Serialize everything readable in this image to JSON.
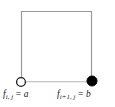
{
  "figure": {
    "background_color": "#ffffff",
    "edge_color": "#9a9a9a",
    "marker_outline_color": "#1a1a1a",
    "marker_fill_open": "#ffffff",
    "marker_fill_closed": "#000000",
    "text_color": "#151515"
  },
  "square": {
    "left": 21,
    "top": 11,
    "right": 92,
    "bottom": 82,
    "stroke_width": 1
  },
  "nodes": [
    {
      "id": "node-open",
      "style": "open-circle",
      "cx": 21,
      "cy": 82,
      "r": 4.5
    },
    {
      "id": "node-filled",
      "style": "filled-circle",
      "cx": 92,
      "cy": 81,
      "r": 5
    }
  ],
  "labels": {
    "left": {
      "symbol": "f",
      "subscript": "i, j",
      "equals": " = ",
      "value": "a",
      "full_text": "f i, j = a"
    },
    "right": {
      "symbol": "f",
      "subscript": "i+1, j",
      "equals": " = ",
      "value": "b",
      "full_text": "f i+1, j = b"
    }
  }
}
